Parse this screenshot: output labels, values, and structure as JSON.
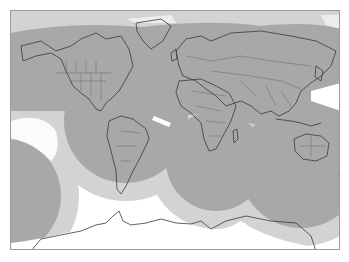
{
  "map": {
    "projection": "mercator",
    "frame": {
      "x": 10,
      "y": 10,
      "width": 330,
      "height": 240
    },
    "colors": {
      "background": "#ffffff",
      "outer_zone": "#d3d3d3",
      "inner_zone": "#a8a8a8",
      "coastline": "#3a3a3a",
      "border": "#555555",
      "frame": "#9a9a9a"
    },
    "legend": [
      {
        "name": "primary-coverage",
        "color": "#a8a8a8"
      },
      {
        "name": "secondary-coverage",
        "color": "#d3d3d3"
      },
      {
        "name": "no-coverage",
        "color": "#ffffff"
      }
    ],
    "zones": [
      {
        "name": "southeast-pacific",
        "cx": -10,
        "cy": 195,
        "r_inner": 60,
        "r_outer": 78
      },
      {
        "name": "south-america",
        "cx": 125,
        "cy": 120,
        "r_inner": 62,
        "r_outer": 80
      },
      {
        "name": "south-atlantic-africa",
        "cx": 215,
        "cy": 160,
        "r_inner": 50,
        "r_outer": 68
      },
      {
        "name": "indian-ocean-australia",
        "cx": 300,
        "cy": 165,
        "r_inner": 62,
        "r_outer": 80
      }
    ]
  }
}
